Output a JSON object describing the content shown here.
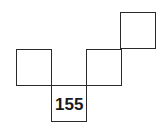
{
  "diagram": {
    "type": "net of squares",
    "squares": [
      {
        "id": "left",
        "label": ""
      },
      {
        "id": "bottom",
        "label": "155"
      },
      {
        "id": "middle",
        "label": ""
      },
      {
        "id": "top-right",
        "label": ""
      }
    ],
    "colors": {
      "line": "#2a2a2a",
      "text": "#1a1a1a",
      "background": "#ffffff"
    }
  }
}
